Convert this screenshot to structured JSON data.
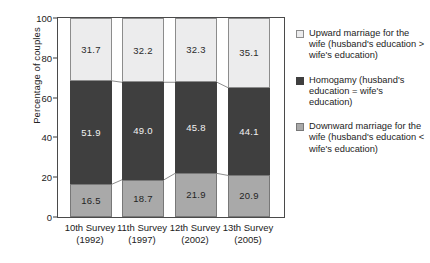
{
  "chart_data": {
    "type": "bar",
    "stacked": true,
    "stack_total": 100,
    "title": "",
    "xlabel": "",
    "ylabel": "Percentage of couples",
    "ylim": [
      0,
      100
    ],
    "yticks": [
      0,
      20,
      40,
      60,
      80,
      100
    ],
    "grid": false,
    "legend_position": "right",
    "categories": [
      "10th Survey (1992)",
      "11th Survey (1997)",
      "12th Survey (2002)",
      "13th Survey (2005)"
    ],
    "category_lines": [
      {
        "line1": "10th Survey",
        "line2": "(1992)"
      },
      {
        "line1": "11th Survey",
        "line2": "(1997)"
      },
      {
        "line1": "12th Survey",
        "line2": "(2002)"
      },
      {
        "line1": "13th Survey",
        "line2": "(2005)"
      }
    ],
    "series": [
      {
        "name": "Downward marriage for the wife (husband's education < wife's education)",
        "short_name": "Downward marriage",
        "color": "#a9a9a9",
        "values": [
          16.5,
          18.7,
          21.9,
          20.9
        ],
        "labels": [
          "16.5",
          "18.7",
          "21.9",
          "20.9"
        ]
      },
      {
        "name": "Homogamy (husband's education = wife's education)",
        "short_name": "Homogamy",
        "color": "#3f3f3f",
        "values": [
          51.9,
          49.0,
          45.8,
          44.1
        ],
        "labels": [
          "51.9",
          "49.0",
          "45.8",
          "44.1"
        ]
      },
      {
        "name": "Upward marriage for the wife (husband's education > wife's education)",
        "short_name": "Upward marriage",
        "color": "#ececed",
        "values": [
          31.7,
          32.2,
          32.3,
          35.1
        ],
        "labels": [
          "31.7",
          "32.2",
          "32.3",
          "35.1"
        ]
      }
    ]
  },
  "axis": {
    "y_title": "Percentage of couples",
    "y_tick_labels": [
      "100",
      "80",
      "60",
      "40",
      "20",
      "0"
    ]
  },
  "legend": {
    "entries": [
      {
        "swatch": "up",
        "text": "Upward marriage for the wife (husband's education > wife's education)"
      },
      {
        "swatch": "homo",
        "text": "Homogamy (husband's education = wife's education)"
      },
      {
        "swatch": "down",
        "text": "Downward marriage for the wife (husband's education < wife's education)"
      }
    ]
  }
}
